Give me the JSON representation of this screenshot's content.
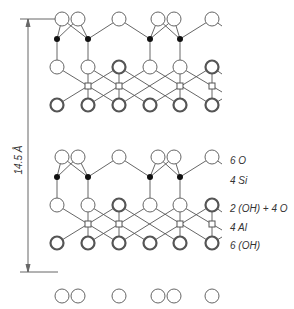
{
  "diagram": {
    "type": "crystal-structure",
    "dimension": {
      "label": "14.5 Å",
      "x": 28,
      "y_top": 19,
      "y_bottom": 272
    },
    "layer_labels": [
      {
        "text": "6 O",
        "y": 162
      },
      {
        "text": "4 Si",
        "y": 182
      },
      {
        "text": "2 (OH) + 4 O",
        "y": 210
      },
      {
        "text": "4 Al",
        "y": 229
      },
      {
        "text": "6 (OH)",
        "y": 247
      }
    ],
    "colors": {
      "line": "#555555",
      "atom_stroke": "#666666",
      "si_fill": "#111111",
      "background": "#ffffff"
    },
    "legend": {
      "open_circle": "O (oxygen)",
      "filled_dot": "Si (silicon)",
      "double_circle": "OH (hydroxyl)",
      "small_square": "Al (aluminium)"
    }
  }
}
